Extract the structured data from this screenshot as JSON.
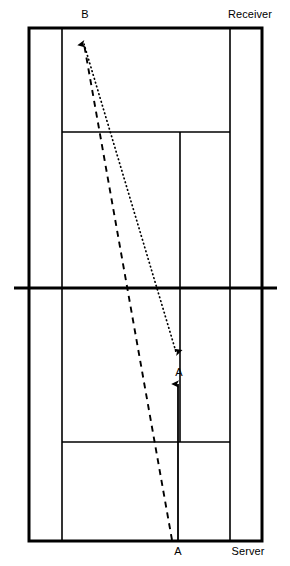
{
  "diagram": {
    "kind": "tennis-court-play-diagram",
    "title": "",
    "background_color": "#ffffff",
    "line_color": "#000000",
    "labels": {
      "b": "B",
      "receiver": "Receiver",
      "a_top": "A",
      "a_bottom": "A",
      "server": "Server"
    },
    "court": {
      "outer": {
        "x": 29,
        "y": 28,
        "width": 233,
        "height": 513
      },
      "outer_stroke_width": 3,
      "inner_stroke_width": 1.6,
      "singles_sideline_left_x": 62,
      "singles_sideline_right_x": 230,
      "net_y": 288,
      "net_x_start": 14,
      "net_x_end": 277,
      "net_stroke_width": 3.2,
      "service_line_top_y": 132,
      "service_line_bottom_y": 442,
      "center_service_line_x": 180
    },
    "paths": {
      "serve_dotted": {
        "style": "dotted",
        "from_x": 84,
        "from_y": 42,
        "to_x": 176,
        "to_y": 354,
        "arrow_at": "end",
        "arrow_direction": "down-right"
      },
      "run_dashed": {
        "style": "dashed",
        "from_x": 172,
        "from_y": 540,
        "to_x": 84,
        "to_y": 40,
        "arrow_at": "end",
        "arrow_direction": "up"
      },
      "move_solid": {
        "style": "solid",
        "from_x": 178,
        "from_y": 540,
        "to_x": 178,
        "to_y": 380,
        "arrow_at": "end",
        "arrow_direction": "up"
      }
    }
  }
}
